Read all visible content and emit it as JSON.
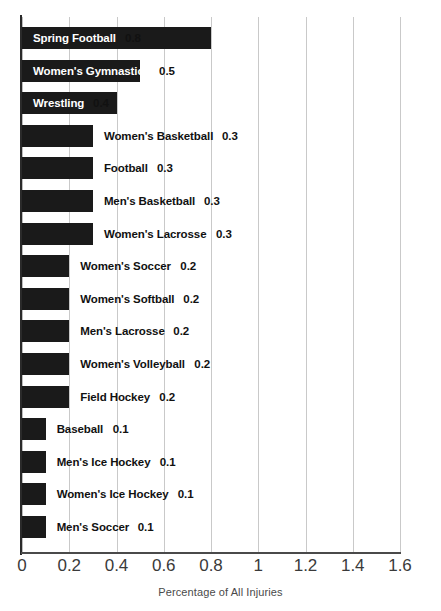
{
  "chart_data": {
    "type": "bar",
    "orientation": "horizontal",
    "title": "",
    "xlabel": "Percentage of All Injuries",
    "ylabel": "",
    "xlim": [
      0,
      1.6
    ],
    "grid": true,
    "legend": "none",
    "xticks": [
      "0",
      "0.2",
      "0.4",
      "0.6",
      "0.8",
      "1",
      "1.2",
      "1.4",
      "1.6"
    ],
    "xtick_values": [
      0,
      0.2,
      0.4,
      0.6,
      0.8,
      1,
      1.2,
      1.4,
      1.6
    ],
    "categories": [
      "Spring Football",
      "Women's Gymnastics",
      "Wrestling",
      "Women's Basketball",
      "Football",
      "Men's Basketball",
      "Women's Lacrosse",
      "Women's Soccer",
      "Women's Softball",
      "Men's Lacrosse",
      "Women's Volleyball",
      "Field Hockey",
      "Baseball",
      "Men's Ice Hockey",
      "Women's Ice Hockey",
      "Men's Soccer"
    ],
    "values": [
      0.8,
      0.5,
      0.4,
      0.3,
      0.3,
      0.3,
      0.3,
      0.2,
      0.2,
      0.2,
      0.2,
      0.2,
      0.1,
      0.1,
      0.1,
      0.1
    ],
    "value_labels": [
      "0.8",
      "0.5",
      "0.4",
      "0.3",
      "0.3",
      "0.3",
      "0.3",
      "0.2",
      "0.2",
      "0.2",
      "0.2",
      "0.2",
      "0.1",
      "0.1",
      "0.1",
      "0.1"
    ],
    "bar_color": "#1a1a1a",
    "grid_color": "#c9c9c9",
    "label_placement": [
      "inside",
      "inside",
      "inside",
      "outside",
      "outside",
      "outside",
      "outside",
      "outside",
      "outside",
      "outside",
      "outside",
      "outside",
      "outside",
      "outside",
      "outside",
      "outside"
    ]
  }
}
